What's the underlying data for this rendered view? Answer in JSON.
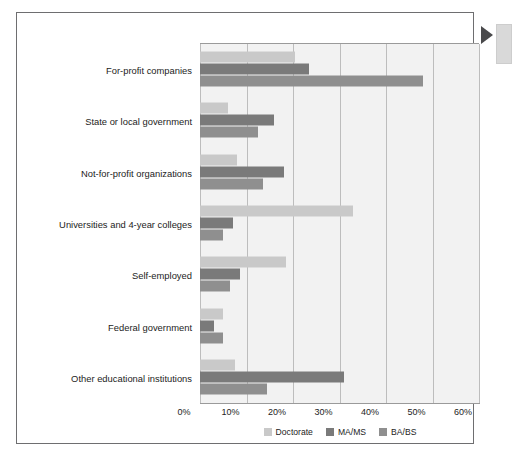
{
  "figure": {
    "edge_pointer_icon": "triangle-right-icon",
    "edge_note_icon": "margin-note-block"
  },
  "chart_data": {
    "type": "bar",
    "orientation": "horizontal",
    "title": "",
    "xlabel": "",
    "ylabel": "",
    "xlim": [
      0,
      60
    ],
    "xunit": "%",
    "grid": true,
    "legend_position": "bottom-center",
    "tick_labels": [
      "0%",
      "10%",
      "20%",
      "30%",
      "40%",
      "50%",
      "60%"
    ],
    "tick_values": [
      0,
      10,
      20,
      30,
      40,
      50,
      60
    ],
    "categories": [
      "For-profit companies",
      "State or local government",
      "Not-for-profit organizations",
      "Universities and 4-year colleges",
      "Self-employed",
      "Federal government",
      "Other educational institutions"
    ],
    "series": [
      {
        "name": "Doctorate",
        "color": "#c9c9c9",
        "values": [
          20.5,
          6.0,
          8.0,
          33.0,
          18.5,
          5.0,
          7.5
        ]
      },
      {
        "name": "MA/MS",
        "color": "#7a7a7a",
        "values": [
          23.5,
          16.0,
          18.0,
          7.0,
          8.5,
          3.0,
          31.0
        ]
      },
      {
        "name": "BA/BS",
        "color": "#8f8f8f",
        "values": [
          48.0,
          12.5,
          13.5,
          5.0,
          6.5,
          5.0,
          14.5
        ]
      }
    ]
  }
}
